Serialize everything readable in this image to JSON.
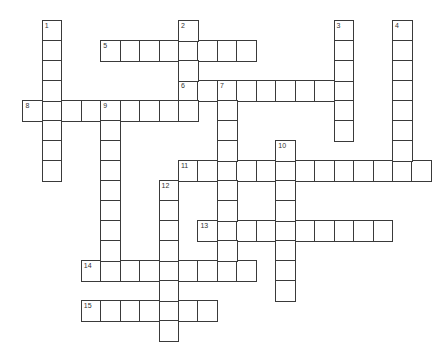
{
  "puzzle": {
    "grid": {
      "origin_x": 23,
      "origin_y": 21,
      "cell_w": 19.45,
      "cell_h": 20,
      "line_color": "#3a3a3a",
      "background": "#ffffff"
    },
    "across": [
      {
        "number": "5",
        "row": 1,
        "col": 4,
        "length": 8
      },
      {
        "number": "6",
        "row": 3,
        "col": 8,
        "length": 9
      },
      {
        "number": "8",
        "row": 4,
        "col": 0,
        "length": 9
      },
      {
        "number": "11",
        "row": 7,
        "col": 8,
        "length": 13
      },
      {
        "number": "13",
        "row": 10,
        "col": 9,
        "length": 10
      },
      {
        "number": "14",
        "row": 12,
        "col": 3,
        "length": 9
      },
      {
        "number": "15",
        "row": 14,
        "col": 3,
        "length": 7
      }
    ],
    "down": [
      {
        "number": "1",
        "row": 0,
        "col": 1,
        "length": 8
      },
      {
        "number": "2",
        "row": 0,
        "col": 8,
        "length": 5
      },
      {
        "number": "3",
        "row": 0,
        "col": 16,
        "length": 6
      },
      {
        "number": "4",
        "row": 0,
        "col": 19,
        "length": 8
      },
      {
        "number": "7",
        "row": 3,
        "col": 10,
        "length": 10
      },
      {
        "number": "9",
        "row": 4,
        "col": 4,
        "length": 9
      },
      {
        "number": "10",
        "row": 6,
        "col": 13,
        "length": 8
      },
      {
        "number": "12",
        "row": 8,
        "col": 7,
        "length": 8
      }
    ]
  }
}
